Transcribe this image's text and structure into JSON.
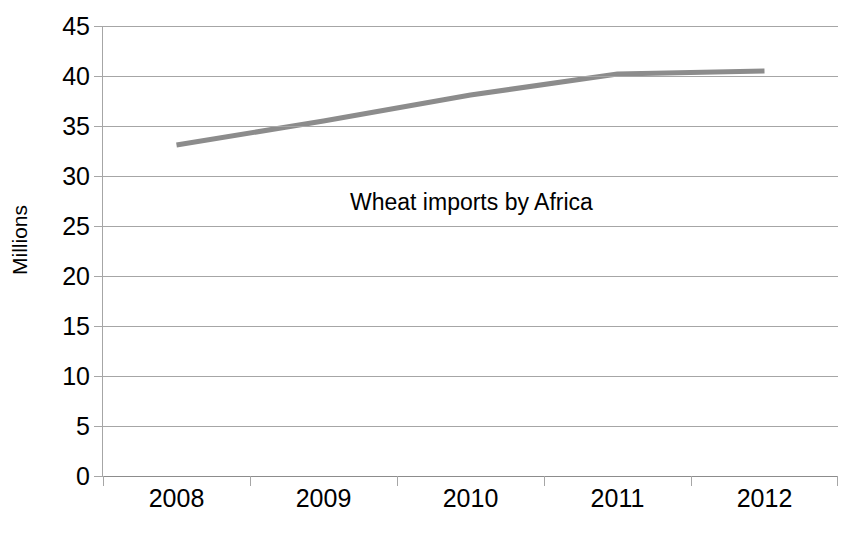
{
  "chart_data": {
    "type": "line",
    "title": "Wheat imports by Africa",
    "xlabel": "",
    "ylabel": "Millions",
    "categories": [
      "2008",
      "2009",
      "2010",
      "2011",
      "2012"
    ],
    "values": [
      33.1,
      35.5,
      38.1,
      40.2,
      40.5
    ],
    "series": [
      {
        "name": "Wheat imports by Africa",
        "values": [
          33.1,
          35.5,
          38.1,
          40.2,
          40.5
        ]
      }
    ],
    "ylim": [
      0,
      45
    ],
    "ytick_labels": [
      "0",
      "5",
      "10",
      "15",
      "20",
      "25",
      "30",
      "35",
      "40",
      "45"
    ],
    "ytick_values": [
      0,
      5,
      10,
      15,
      20,
      25,
      30,
      35,
      40,
      45
    ],
    "grid": true,
    "legend": "none",
    "line_color": "#8c8c8c",
    "grid_color": "#a6a6a6",
    "background_color": "#ffffff",
    "text_color": "#000000"
  }
}
